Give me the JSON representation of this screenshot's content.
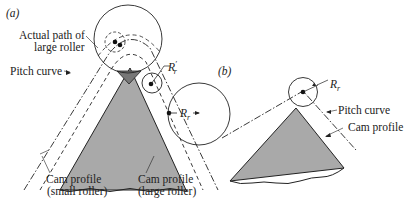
{
  "figure": {
    "colors": {
      "cam_fill": "#a9a9a9",
      "line": "#222222",
      "background": "#ffffff"
    },
    "panel_a": {
      "tag": "(a)",
      "labels": {
        "actual_path_line1": "Actual path of",
        "actual_path_line2": "large roller",
        "pitch_curve": "Pitch curve",
        "r_prime": "R",
        "r_prime_sub": "r",
        "r_prime_mark": "′",
        "r": "R",
        "r_sub": "r",
        "cam_small_line1": "Cam profile",
        "cam_small_line2": "(small roller)",
        "cam_large_line1": "Cam profile",
        "cam_large_line2": "(large roller)"
      }
    },
    "panel_b": {
      "tag": "(b)",
      "labels": {
        "r": "R",
        "r_sub": "r",
        "pitch_curve": "Pitch curve",
        "cam_profile": "Cam profile"
      }
    }
  }
}
